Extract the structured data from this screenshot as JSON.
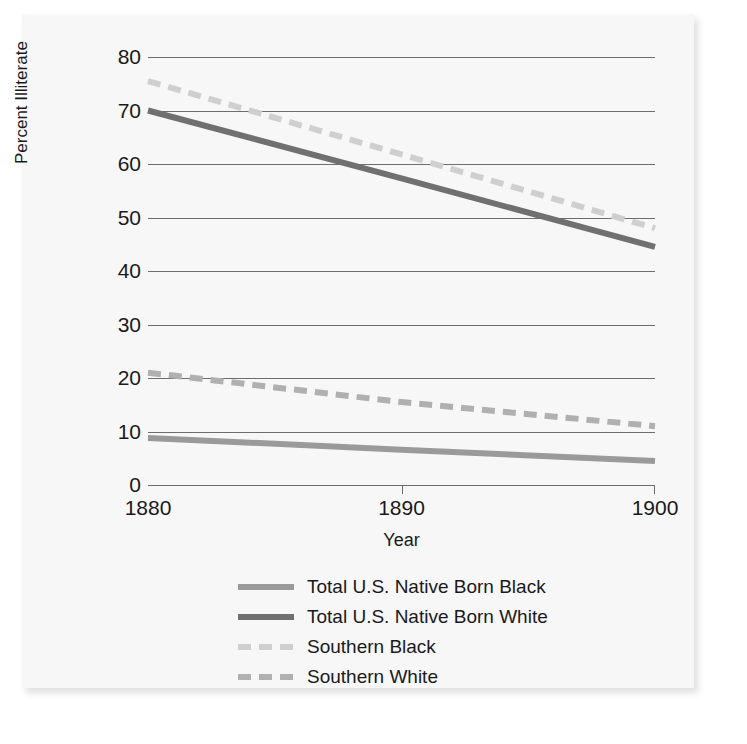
{
  "chart_data": {
    "type": "line",
    "title": "",
    "xlabel": "Year",
    "ylabel": "Percent Illiterate",
    "x": [
      1880,
      1890,
      1900
    ],
    "xlim": [
      1880,
      1900
    ],
    "ylim": [
      0,
      80
    ],
    "xticks": [
      "1880",
      "1890",
      "1900"
    ],
    "yticks": [
      "0",
      "10",
      "20",
      "30",
      "40",
      "50",
      "60",
      "70",
      "80"
    ],
    "grid": "horizontal",
    "legend_position": "below",
    "series": [
      {
        "name": "Total U.S. Native Born Black",
        "values": [
          8.8,
          6.6,
          4.5
        ],
        "color": "#9a9a9a",
        "style": "solid",
        "width": 6
      },
      {
        "name": "Total U.S. Native Born White",
        "values": [
          70.0,
          57.3,
          44.5
        ],
        "color": "#707070",
        "style": "solid",
        "width": 6
      },
      {
        "name": "Southern Black",
        "values": [
          75.5,
          61.8,
          48.0
        ],
        "color": "#cfcfcf",
        "style": "dashed",
        "width": 6
      },
      {
        "name": "Southern White",
        "values": [
          21.0,
          15.5,
          11.0
        ],
        "color": "#b0b0b0",
        "style": "dashed",
        "width": 6
      }
    ]
  },
  "legend": {
    "items": [
      {
        "label": "Total U.S. Native Born Black"
      },
      {
        "label": "Total U.S. Native Born White"
      },
      {
        "label": "Southern Black"
      },
      {
        "label": "Southern White"
      }
    ]
  },
  "colors": {
    "panel_background": "#f7f7f7",
    "page_background": "#ffffff",
    "gridline": "#6d6d6d",
    "text": "#1a1a1a"
  }
}
